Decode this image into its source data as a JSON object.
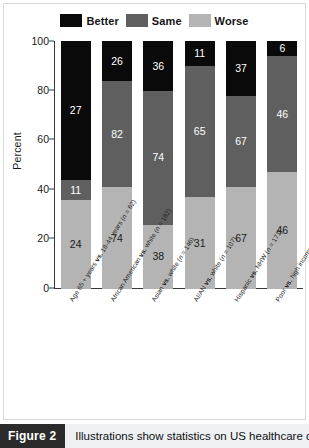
{
  "figure": {
    "caption_tag": "Figure 2",
    "caption_text": "Illustrations show statistics on US healthcare dis-"
  },
  "legend": {
    "items": [
      {
        "label": "Better",
        "color": "#0a0a0a",
        "icon": "legend-swatch-better"
      },
      {
        "label": "Same",
        "color": "#5f5f5f",
        "icon": "legend-swatch-same"
      },
      {
        "label": "Worse",
        "color": "#b4b4b4",
        "icon": "legend-swatch-worse"
      }
    ]
  },
  "axis": {
    "ylabel": "Percent",
    "yticks": [
      "0",
      "20",
      "40",
      "60",
      "80",
      "100"
    ]
  },
  "chart_data": {
    "type": "bar",
    "title": "",
    "subtitle": "",
    "xlabel": "",
    "ylabel": "Percent",
    "ylim": [
      0,
      100
    ],
    "yticks": [
      0,
      20,
      40,
      60,
      80,
      100
    ],
    "grid": false,
    "stacked": true,
    "legend_position": "top-center",
    "categories": [
      "Age 65 + years vs. 18-44 years (n = 62)",
      "African American vs. white (n = 182)",
      "Asian vs. white (n = 146)",
      "AI/AN vs. white (n = 107)",
      "Hispanic vs. NHW (n = 171)",
      "Poor vs. high income (n = 98)"
    ],
    "category_parts": [
      {
        "pre": "Age 65 + years ",
        "vs": "vs.",
        "post": " 18-44 years (",
        "n_italic": "n",
        "n_rest": " = 62)"
      },
      {
        "pre": "African American ",
        "vs": "vs.",
        "post": " white (",
        "n_italic": "n",
        "n_rest": " = 182)"
      },
      {
        "pre": "Asian ",
        "vs": "vs.",
        "post": " white (",
        "n_italic": "n",
        "n_rest": " = 146)"
      },
      {
        "pre": "AI/AN ",
        "vs": "vs.",
        "post": " white (",
        "n_italic": "n",
        "n_rest": " = 107)"
      },
      {
        "pre": "Hispanic ",
        "vs": "vs.",
        "post": " NHW (",
        "n_italic": "n",
        "n_rest": " = 171)"
      },
      {
        "pre": "Poor ",
        "vs": "vs.",
        "post": " high income (",
        "n_italic": "n",
        "n_rest": " = 98)"
      }
    ],
    "series": [
      {
        "name": "Worse",
        "color": "#b4b4b4",
        "values": [
          24,
          74,
          38,
          31,
          67,
          46
        ],
        "segment_spans": [
          36.0,
          41.0,
          26.0,
          37.0,
          41.0,
          47.0
        ]
      },
      {
        "name": "Same",
        "color": "#5f5f5f",
        "values": [
          11,
          82,
          74,
          65,
          67,
          46
        ],
        "segment_spans": [
          8.0,
          43.0,
          54.0,
          53.0,
          37.0,
          47.0
        ]
      },
      {
        "name": "Better",
        "color": "#0a0a0a",
        "values": [
          27,
          26,
          36,
          11,
          37,
          6
        ],
        "segment_spans": [
          56.0,
          16.0,
          20.0,
          10.0,
          22.0,
          6.0
        ]
      }
    ]
  }
}
